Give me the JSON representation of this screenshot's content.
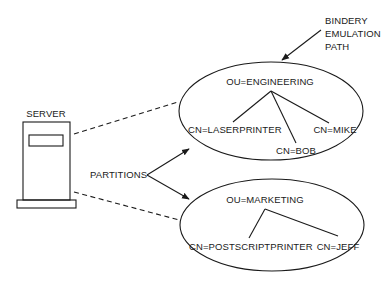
{
  "diagram": {
    "server": {
      "label": "SERVER"
    },
    "partitions_label": "PARTITIONS",
    "bindery": {
      "line1": "BINDERY",
      "line2": "EMULATION",
      "line3": "PATH"
    },
    "engineering": {
      "root": "OU=ENGINEERING",
      "children": [
        "CN=LASERPRINTER",
        "CN=BOB",
        "CN=MIKE"
      ]
    },
    "marketing": {
      "root": "OU=MARKETING",
      "children": [
        "CN=POSTSCRIPTPRINTER",
        "CN=JEFF"
      ]
    },
    "colors": {
      "ink": "#1a1a1a",
      "background": "#ffffff"
    }
  }
}
